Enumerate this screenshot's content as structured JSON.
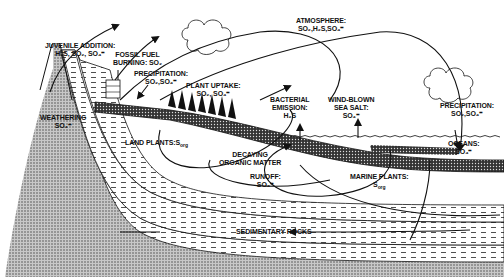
{
  "diagram": {
    "colors": {
      "ink": "#111111",
      "background": "#ffffff",
      "stipple": "#9a9a9a"
    },
    "labels": {
      "juvenile": {
        "line1": "JUVENILE ADDITION:",
        "line2": "H₂S, SO₂, SO₄⁼"
      },
      "fossil": {
        "line1": "FOSSIL FUEL",
        "line2": "BURNING: SO₂"
      },
      "precip_left": {
        "line1": "PRECIPITATION:",
        "line2": "SO₂,SO₄⁼"
      },
      "plant_uptake": {
        "line1": "PLANT UPTAKE:",
        "line2": "SO₂, SO₄⁼"
      },
      "atmosphere": {
        "line1": "ATMOSPHERE:",
        "line2": "SO₂,H₂S,SO₄⁼"
      },
      "weathering": {
        "line1": "WEATHERING",
        "line2": "SO₄⁼"
      },
      "land_plants": {
        "line1": "LAND PLANTS:S",
        "sub": "org"
      },
      "bacterial": {
        "line1": "BACTERIAL",
        "line2": "EMISSION:",
        "line3": "H₂S"
      },
      "wind_blown": {
        "line1": "WIND-BLOWN",
        "line2": "SEA SALT:",
        "line3": "SO₄⁼"
      },
      "precip_right": {
        "line1": "PRECIPITATION:",
        "line2": "SO₂,SO₄⁼"
      },
      "oceans": {
        "line1": "OCEANS:",
        "line2": "SO₄⁼"
      },
      "decaying": {
        "line1": "DECAYING",
        "line2": "ORGANIC MATTER"
      },
      "runoff": {
        "line1": "RUNOFF:",
        "line2": "SO₄⁼"
      },
      "marine_plants": {
        "line1": "MARINE PLANTS:",
        "line2": "S",
        "sub": "org"
      },
      "sedimentary": {
        "line1": "SEDIMENTARY ROCKS"
      }
    }
  }
}
